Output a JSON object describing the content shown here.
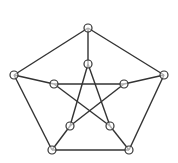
{
  "diagram": {
    "type": "graph",
    "name": "Petersen graph",
    "stroke_color": "#333333",
    "node_fill": "#ffffff",
    "node_radius": 4,
    "nodes": [
      {
        "id": "o0",
        "x": 88,
        "y": 28
      },
      {
        "id": "o1",
        "x": 164,
        "y": 75
      },
      {
        "id": "o2",
        "x": 129,
        "y": 150
      },
      {
        "id": "o3",
        "x": 52,
        "y": 150
      },
      {
        "id": "o4",
        "x": 14,
        "y": 75
      },
      {
        "id": "i0",
        "x": 88,
        "y": 64
      },
      {
        "id": "i1",
        "x": 124,
        "y": 84
      },
      {
        "id": "i2",
        "x": 110,
        "y": 126
      },
      {
        "id": "i3",
        "x": 70,
        "y": 126
      },
      {
        "id": "i4",
        "x": 54,
        "y": 84
      }
    ],
    "edges": [
      [
        "o0",
        "o1"
      ],
      [
        "o1",
        "o2"
      ],
      [
        "o2",
        "o3"
      ],
      [
        "o3",
        "o4"
      ],
      [
        "o4",
        "o0"
      ],
      [
        "o0",
        "i0"
      ],
      [
        "o1",
        "i1"
      ],
      [
        "o2",
        "i2"
      ],
      [
        "o3",
        "i3"
      ],
      [
        "o4",
        "i4"
      ],
      [
        "i0",
        "i2"
      ],
      [
        "i2",
        "i4"
      ],
      [
        "i4",
        "i1"
      ],
      [
        "i1",
        "i3"
      ],
      [
        "i3",
        "i0"
      ]
    ]
  }
}
